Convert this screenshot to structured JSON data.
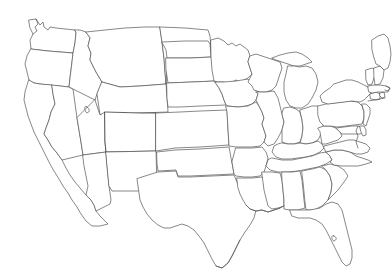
{
  "figure": {
    "name": "us-state-locator-map",
    "title": "Map of the United States with Colorado highlighted",
    "projection": "albers-usa-like",
    "background_color": "#ffffff",
    "outline_color": "#555558",
    "highlight_fill_color": "#8a8a8a",
    "default_fill_color": "#ffffff",
    "width": 392,
    "height": 273,
    "has_labels": false,
    "has_border": false
  },
  "highlight": {
    "state_name": "Colorado",
    "state_code": "CO",
    "fill_style": "dithered-halftone-gray",
    "fill_color": "#8a8a8a",
    "bounds": {
      "x": 105,
      "y": 112,
      "width": 51,
      "height": 40
    }
  },
  "regions": [
    {
      "code": "WA",
      "name": "Washington",
      "highlighted": false
    },
    {
      "code": "OR",
      "name": "Oregon",
      "highlighted": false
    },
    {
      "code": "CA",
      "name": "California",
      "highlighted": false
    },
    {
      "code": "NV",
      "name": "Nevada",
      "highlighted": false
    },
    {
      "code": "ID",
      "name": "Idaho",
      "highlighted": false
    },
    {
      "code": "MT",
      "name": "Montana",
      "highlighted": false
    },
    {
      "code": "WY",
      "name": "Wyoming",
      "highlighted": false
    },
    {
      "code": "UT",
      "name": "Utah",
      "highlighted": false
    },
    {
      "code": "AZ",
      "name": "Arizona",
      "highlighted": false
    },
    {
      "code": "CO",
      "name": "Colorado",
      "highlighted": true
    },
    {
      "code": "NM",
      "name": "New Mexico",
      "highlighted": false
    },
    {
      "code": "ND",
      "name": "North Dakota",
      "highlighted": false
    },
    {
      "code": "SD",
      "name": "South Dakota",
      "highlighted": false
    },
    {
      "code": "NE",
      "name": "Nebraska",
      "highlighted": false
    },
    {
      "code": "KS",
      "name": "Kansas",
      "highlighted": false
    },
    {
      "code": "OK",
      "name": "Oklahoma",
      "highlighted": false
    },
    {
      "code": "TX",
      "name": "Texas",
      "highlighted": false
    },
    {
      "code": "MN",
      "name": "Minnesota",
      "highlighted": false
    },
    {
      "code": "IA",
      "name": "Iowa",
      "highlighted": false
    },
    {
      "code": "MO",
      "name": "Missouri",
      "highlighted": false
    },
    {
      "code": "AR",
      "name": "Arkansas",
      "highlighted": false
    },
    {
      "code": "LA",
      "name": "Louisiana",
      "highlighted": false
    },
    {
      "code": "WI",
      "name": "Wisconsin",
      "highlighted": false
    },
    {
      "code": "IL",
      "name": "Illinois",
      "highlighted": false
    },
    {
      "code": "MI",
      "name": "Michigan",
      "highlighted": false
    },
    {
      "code": "IN",
      "name": "Indiana",
      "highlighted": false
    },
    {
      "code": "OH",
      "name": "Ohio",
      "highlighted": false
    },
    {
      "code": "KY",
      "name": "Kentucky",
      "highlighted": false
    },
    {
      "code": "TN",
      "name": "Tennessee",
      "highlighted": false
    },
    {
      "code": "MS",
      "name": "Mississippi",
      "highlighted": false
    },
    {
      "code": "AL",
      "name": "Alabama",
      "highlighted": false
    },
    {
      "code": "GA",
      "name": "Georgia",
      "highlighted": false
    },
    {
      "code": "FL",
      "name": "Florida",
      "highlighted": false
    },
    {
      "code": "SC",
      "name": "South Carolina",
      "highlighted": false
    },
    {
      "code": "NC",
      "name": "North Carolina",
      "highlighted": false
    },
    {
      "code": "VA",
      "name": "Virginia",
      "highlighted": false
    },
    {
      "code": "WV",
      "name": "West Virginia",
      "highlighted": false
    },
    {
      "code": "MD",
      "name": "Maryland",
      "highlighted": false
    },
    {
      "code": "DE",
      "name": "Delaware",
      "highlighted": false
    },
    {
      "code": "PA",
      "name": "Pennsylvania",
      "highlighted": false
    },
    {
      "code": "NJ",
      "name": "New Jersey",
      "highlighted": false
    },
    {
      "code": "NY",
      "name": "New York",
      "highlighted": false
    },
    {
      "code": "CT",
      "name": "Connecticut",
      "highlighted": false
    },
    {
      "code": "RI",
      "name": "Rhode Island",
      "highlighted": false
    },
    {
      "code": "MA",
      "name": "Massachusetts",
      "highlighted": false
    },
    {
      "code": "VT",
      "name": "Vermont",
      "highlighted": false
    },
    {
      "code": "NH",
      "name": "New Hampshire",
      "highlighted": false
    },
    {
      "code": "ME",
      "name": "Maine",
      "highlighted": false
    }
  ]
}
